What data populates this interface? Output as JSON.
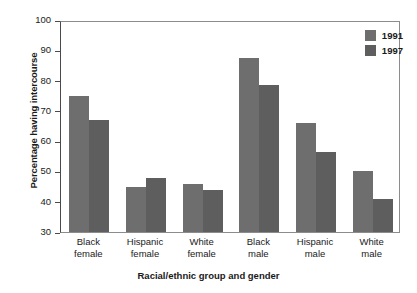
{
  "chart_data": {
    "type": "bar",
    "title": "",
    "xlabel": "Racial/ethnic group and gender",
    "ylabel": "Percentage having intercourse",
    "categories": [
      "Black\nfemale",
      "Hispanic\nfemale",
      "White\nfemale",
      "Black\nmale",
      "Hispanic\nmale",
      "White\nmale"
    ],
    "series": [
      {
        "name": "1991",
        "color": "#6e6e6e",
        "values": [
          75,
          44.8,
          46,
          87.5,
          66,
          50
        ]
      },
      {
        "name": "1997",
        "color": "#5e5e5e",
        "values": [
          67,
          47.8,
          44,
          78.7,
          56.5,
          41
        ]
      }
    ],
    "ylim": [
      30,
      100
    ],
    "yticks": [
      30,
      40,
      50,
      60,
      70,
      80,
      90,
      100
    ],
    "ytick_labels": [
      "30",
      "40",
      "50",
      "60",
      "70",
      "80",
      "90",
      "100"
    ],
    "grid": false,
    "legend_position": "top-right"
  }
}
